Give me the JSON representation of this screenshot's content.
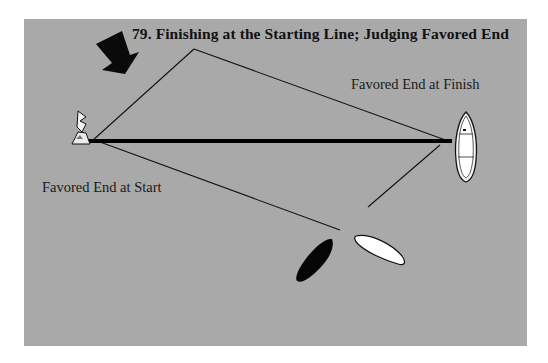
{
  "figure": {
    "number": "79.",
    "title": "79.  Finishing at the Starting Line; Judging Favored End",
    "labels": {
      "favored_finish": "Favored End at Finish",
      "favored_start": "Favored End at Start"
    },
    "elements": {
      "wind_arrow": "wind-direction-arrow",
      "pin_flag": "pin-end-flag-buoy",
      "committee_boat": "committee-boat",
      "black_boat": "sailboat-black",
      "white_boat": "sailboat-white",
      "line": "starting-finish-line"
    },
    "colors": {
      "panel": "#a9a9a9",
      "line": "#000000",
      "white_boat": "#ffffff",
      "black_boat": "#000000"
    }
  }
}
